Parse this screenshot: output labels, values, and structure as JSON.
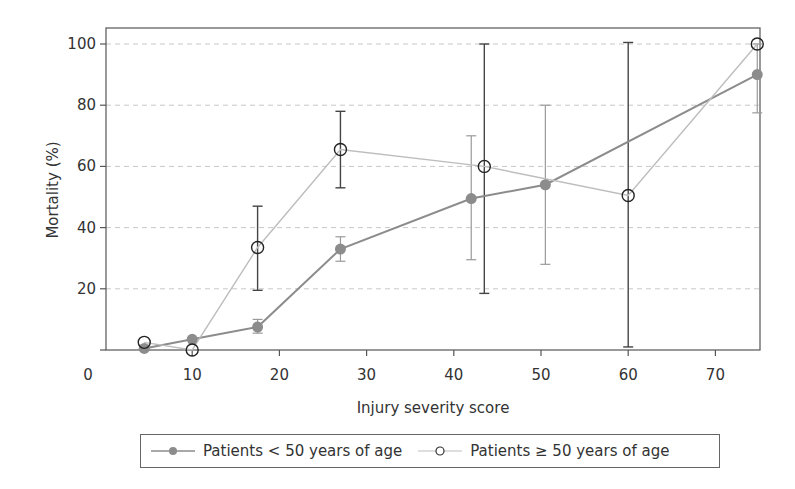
{
  "chart_data": {
    "type": "line",
    "title": "",
    "xlabel": "Injury severity score",
    "ylabel": "Mortality (%)",
    "xlim": [
      0,
      75
    ],
    "ylim": [
      0,
      105
    ],
    "x_ticks": [
      0,
      10,
      20,
      30,
      40,
      50,
      60,
      70
    ],
    "y_ticks": [
      20,
      40,
      60,
      80,
      100
    ],
    "grid": "horizontal dashed at y ticks",
    "legend_position": "bottom, boxed",
    "series": [
      {
        "name": "Patients < 50 years of age",
        "marker": "filled-circle",
        "color": "#8c8c8c",
        "points": [
          {
            "x": 4.5,
            "y": 0.5,
            "err_low": null,
            "err_high": null
          },
          {
            "x": 10,
            "y": 3.5,
            "err_low": null,
            "err_high": null
          },
          {
            "x": 17.5,
            "y": 7.5,
            "err_low": 5.5,
            "err_high": 10
          },
          {
            "x": 27,
            "y": 33,
            "err_low": 29,
            "err_high": 37
          },
          {
            "x": 42,
            "y": 49.5,
            "err_low": 29.5,
            "err_high": 70
          },
          {
            "x": 50.5,
            "y": 54,
            "err_low": 28,
            "err_high": 80
          },
          {
            "x": 74.8,
            "y": 90,
            "err_low": 77.5,
            "err_high": 100
          }
        ]
      },
      {
        "name": "Patients ≥ 50 years of age",
        "marker": "open-circle",
        "color": "#bdbdbd",
        "points": [
          {
            "x": 4.5,
            "y": 2.5,
            "err_low": null,
            "err_high": null
          },
          {
            "x": 10,
            "y": 0,
            "err_low": null,
            "err_high": null
          },
          {
            "x": 17.5,
            "y": 33.5,
            "err_low": 19.5,
            "err_high": 47
          },
          {
            "x": 27,
            "y": 65.5,
            "err_low": 53,
            "err_high": 78
          },
          {
            "x": 43.5,
            "y": 60,
            "err_low": 18.5,
            "err_high": 100
          },
          {
            "x": 60,
            "y": 50.5,
            "err_low": 1,
            "err_high": 100.5
          },
          {
            "x": 74.8,
            "y": 100,
            "err_low": null,
            "err_high": null
          }
        ]
      }
    ]
  },
  "legend": {
    "item1": "Patients < 50 years of age",
    "item2": "Patients ≥ 50 years of age"
  },
  "axes": {
    "xlabel": "Injury severity score",
    "ylabel": "Mortality (%)"
  }
}
